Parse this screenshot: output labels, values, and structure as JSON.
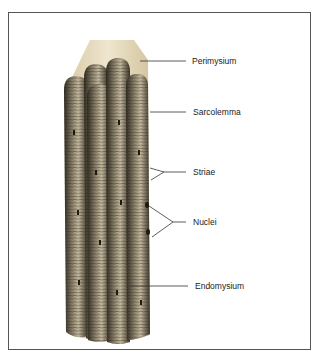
{
  "diagram": {
    "labels": [
      {
        "id": "perimysium",
        "text": "Perimysium"
      },
      {
        "id": "sarcolemma",
        "text": "Sarcolemma"
      },
      {
        "id": "striae",
        "text": "Striae"
      },
      {
        "id": "nuclei",
        "text": "Nuclei"
      },
      {
        "id": "endomysium",
        "text": "Endomysium"
      }
    ]
  },
  "colors": {
    "frame": "#555555",
    "sheath": "#e8dcc0",
    "fiber_dark": "#3a3428",
    "fiber_light": "#b8ad92",
    "leader_line": "#333333"
  }
}
